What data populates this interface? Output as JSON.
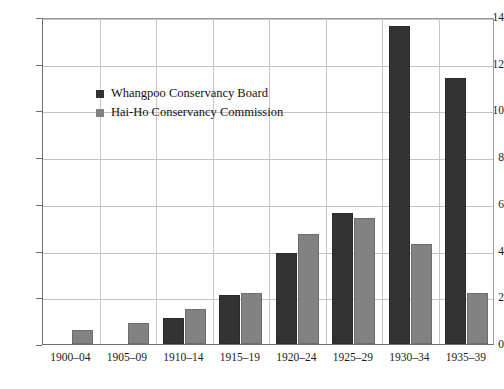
{
  "chart_data": {
    "type": "bar",
    "title": "",
    "subtitle": "",
    "xlabel": "",
    "ylabel": "",
    "categories": [
      "1900–04",
      "1905–09",
      "1910–14",
      "1915–19",
      "1920–24",
      "1925–29",
      "1930–34",
      "1935–39"
    ],
    "series": [
      {
        "name": "Whangpoo Conservancy Board",
        "color": "#333333",
        "values": [
          0,
          0,
          1.1,
          2.1,
          3.9,
          5.6,
          13.6,
          11.4
        ]
      },
      {
        "name": "Hai-Ho Conservancy Commission",
        "color": "#828282",
        "values": [
          0.6,
          0.9,
          1.5,
          2.2,
          4.7,
          5.4,
          4.3,
          2.2
        ]
      }
    ],
    "ylim": [
      0,
      14
    ],
    "yticks": [
      0,
      2,
      4,
      6,
      8,
      10,
      12,
      14
    ],
    "ytick_labels": [
      "0",
      "2",
      "4",
      "6",
      "8",
      "10",
      "12",
      "14"
    ],
    "grid": "horizontal-and-vertical",
    "legend_position": "upper-left-inside"
  },
  "legend": {
    "items": [
      {
        "label": "Whangpoo Conservancy Board",
        "swatch": "dark-square-icon"
      },
      {
        "label": "Hai-Ho Conservancy Commission",
        "swatch": "gray-square-icon"
      }
    ]
  }
}
